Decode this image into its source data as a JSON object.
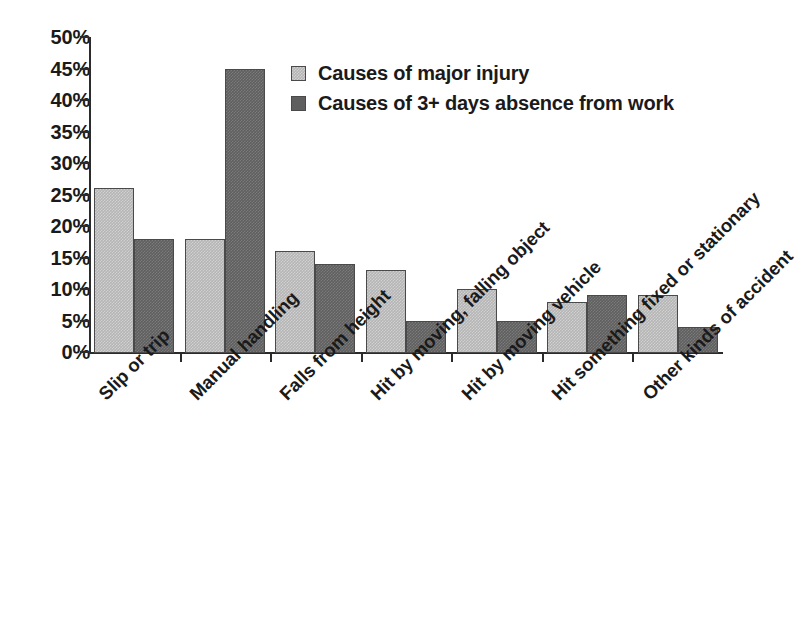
{
  "chart_data": {
    "type": "bar",
    "title": "",
    "subtitle": "",
    "xlabel": "",
    "ylabel": "",
    "ylim": [
      0,
      50
    ],
    "ytick_labels": [
      "50%",
      "45%",
      "40%",
      "35%",
      "30%",
      "25%",
      "20%",
      "15%",
      "10%",
      "5%",
      "0%"
    ],
    "ytick_values": [
      50,
      45,
      40,
      35,
      30,
      25,
      20,
      15,
      10,
      5,
      0
    ],
    "ytick_suffix": "%",
    "grid": false,
    "legend_position": "top-center",
    "categories": [
      "Slip or trip",
      "Manual handling",
      "Falls from height",
      "Hit by moving, falling object",
      "Hit by moving vehicle",
      "Hit something fixed or stationary",
      "Other kinds of accident"
    ],
    "series": [
      {
        "name": "Causes of major injury",
        "color": "#b5b5b5",
        "values": [
          26,
          18,
          16,
          13,
          10,
          8,
          9
        ]
      },
      {
        "name": "Causes of 3+ days absence from work",
        "color": "#5f5f5f",
        "values": [
          18,
          45,
          14,
          5,
          5,
          9,
          4
        ]
      }
    ],
    "annotations": []
  },
  "legend": {
    "entries": [
      {
        "label": "Causes of major injury"
      },
      {
        "label": "Causes of 3+ days absence from work"
      }
    ]
  },
  "axes": {
    "plot_left": 89,
    "plot_right": 723,
    "plot_top": 37,
    "plot_bottom": 352
  }
}
